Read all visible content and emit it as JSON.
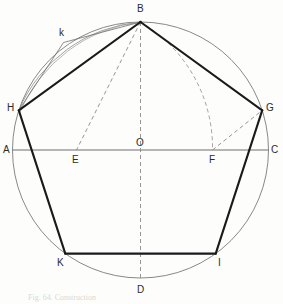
{
  "figure": {
    "kind": "geometric-construction",
    "caption": "Fig. 64. Construction",
    "colors": {
      "ink": "#1a1a1a",
      "thin_ink": "#6e6e6e",
      "circle": "#7a7a78",
      "dashed": "#8a8a88",
      "paper": "#fdfdfc",
      "label": "#2b2b2b"
    },
    "circle": {
      "cx": 140.5,
      "cy": 150,
      "r": 128
    },
    "points": {
      "A": {
        "x": 12.5,
        "y": 150,
        "label": "A",
        "label_x": 3,
        "label_y": 145,
        "on_circle": true
      },
      "B": {
        "x": 140.5,
        "y": 22,
        "label": "B",
        "label_x": 137,
        "label_y": 4,
        "on_circle": true
      },
      "C": {
        "x": 268.5,
        "y": 150,
        "label": "C",
        "label_x": 271,
        "label_y": 145,
        "on_circle": true
      },
      "D": {
        "x": 140.5,
        "y": 278,
        "label": "D",
        "label_x": 137,
        "label_y": 285,
        "on_circle": true
      },
      "E": {
        "x": 76.5,
        "y": 150,
        "label": "E",
        "label_x": 72,
        "label_y": 155,
        "on_circle": false
      },
      "F": {
        "x": 212.5,
        "y": 150,
        "label": "F",
        "label_x": 209,
        "label_y": 155,
        "on_circle": false
      },
      "G": {
        "x": 262.2,
        "y": 110.4,
        "label": "G",
        "label_x": 266,
        "label_y": 103,
        "on_circle": true
      },
      "H": {
        "x": 18.8,
        "y": 110.4,
        "label": "H",
        "label_x": 7,
        "label_y": 103,
        "on_circle": true
      },
      "I": {
        "x": 215.7,
        "y": 253.6,
        "label": "I",
        "label_x": 218,
        "label_y": 258,
        "on_circle": true
      },
      "K": {
        "x": 65.3,
        "y": 253.6,
        "label": "K",
        "label_x": 57,
        "label_y": 258,
        "on_circle": true
      },
      "O": {
        "x": 140.5,
        "y": 150,
        "label": "O",
        "label_x": 136,
        "label_y": 138,
        "on_circle": false
      },
      "k": {
        "x": 63.5,
        "y": 42.5,
        "label": "k",
        "label_x": 59,
        "label_y": 28,
        "on_circle": true
      }
    },
    "pentagon_vertices": [
      "B",
      "G",
      "I",
      "K",
      "H"
    ],
    "solid_edges": [
      [
        "B",
        "G"
      ],
      [
        "G",
        "I"
      ],
      [
        "I",
        "K"
      ],
      [
        "K",
        "H"
      ],
      [
        "H",
        "B"
      ]
    ],
    "thin_lines": [
      [
        "A",
        "C"
      ],
      [
        "B",
        "k"
      ],
      [
        "k",
        "H"
      ]
    ],
    "dashed_lines": [
      [
        "B",
        "D"
      ],
      [
        "B",
        "E"
      ],
      [
        "F",
        "G"
      ]
    ],
    "dashed_arcs": [
      {
        "center": "F",
        "from": "B",
        "to": "F",
        "note": "arc FB swung to diameter"
      }
    ],
    "thin_arcs": [
      {
        "center": "F",
        "from": "B",
        "to": "H",
        "note": "arc of radius BF cutting circle at k / H"
      }
    ]
  },
  "labels_order": [
    "A",
    "B",
    "C",
    "D",
    "E",
    "F",
    "G",
    "H",
    "I",
    "K",
    "O",
    "k"
  ]
}
